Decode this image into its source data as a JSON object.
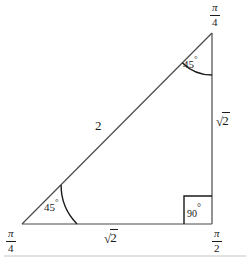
{
  "figure": {
    "type": "geometry-diagram",
    "shape": "right-triangle",
    "colors": {
      "stroke": "#4a4a4a",
      "text": "#1a1a1a",
      "arc": "#1a1a1a",
      "background": "#ffffff",
      "rule": "#d8d8d8"
    },
    "vertices": [
      {
        "id": "bottom-left",
        "x": 22,
        "y": 224,
        "angle_label_num": "π",
        "angle_label_den": "4"
      },
      {
        "id": "top-right",
        "x": 212,
        "y": 33,
        "angle_label_num": "π",
        "angle_label_den": "4"
      },
      {
        "id": "bottom-right",
        "x": 212,
        "y": 224,
        "angle_label_num": "π",
        "angle_label_den": "2"
      }
    ],
    "vertex_labels": {
      "top_right": {
        "numerator": "π",
        "denominator": "4"
      },
      "bottom_left": {
        "numerator": "π",
        "denominator": "4"
      },
      "bottom_right": {
        "numerator": "π",
        "denominator": "2"
      }
    },
    "side_labels": {
      "hypotenuse": "2",
      "vertical_leg": {
        "radical": "√",
        "radicand": "2"
      },
      "horizontal_leg": {
        "radical": "√",
        "radicand": "2"
      }
    },
    "angle_labels": {
      "top_vertex": {
        "value": "45",
        "unit": "°"
      },
      "bottom_left_vertex": {
        "value": "45",
        "unit": "°"
      },
      "right_angle": {
        "value": "90",
        "unit": "°"
      }
    },
    "arcs": [
      {
        "id": "arc-top",
        "center": "top-right",
        "radius": 42
      },
      {
        "id": "arc-bottom-left",
        "center": "bottom-left",
        "radius": 55
      }
    ],
    "right_angle_marker": {
      "size": 28,
      "style": "square-box"
    },
    "footer_rule": {
      "y": 256
    }
  }
}
